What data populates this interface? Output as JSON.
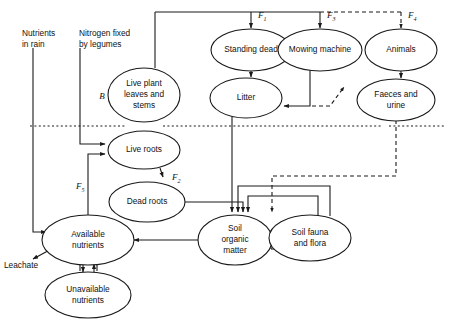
{
  "figure": {
    "type": "flow-diagram",
    "boundary_label": "soil surface dotted line"
  },
  "nodes": {
    "standing_dead": {
      "label": "Standing dead",
      "cx": 251,
      "cy": 50,
      "rx": 40,
      "ry": 20
    },
    "mowing_machine": {
      "label": "Mowing machine",
      "cx": 320,
      "cy": 50,
      "rx": 42,
      "ry": 20
    },
    "animals": {
      "label": "Animals",
      "cx": 401,
      "cy": 50,
      "rx": 36,
      "ry": 20
    },
    "litter": {
      "label": "Litter",
      "cx": 246,
      "cy": 98,
      "rx": 34,
      "ry": 19
    },
    "faeces_and_urine": {
      "label_line1": "Faeces and",
      "label_line2": "urine",
      "cx": 396,
      "cy": 100,
      "rx": 38,
      "ry": 20
    },
    "live_plant": {
      "label_line1": "Live plant",
      "label_line2": "leaves and",
      "label_line3": "stems",
      "cx": 144,
      "cy": 95,
      "rx": 36,
      "ry": 26
    },
    "live_roots": {
      "label": "Live roots",
      "cx": 144,
      "cy": 150,
      "rx": 36,
      "ry": 19
    },
    "dead_roots": {
      "label": "Dead roots",
      "cx": 147,
      "cy": 202,
      "rx": 37,
      "ry": 19
    },
    "available_nutrients": {
      "label_line1": "Available",
      "label_line2": "nutrients",
      "cx": 88,
      "cy": 240,
      "rx": 45,
      "ry": 24
    },
    "unavailable_nutrients": {
      "label_line1": "Unavailable",
      "label_line2": "nutrients",
      "cx": 88,
      "cy": 295,
      "rx": 42,
      "ry": 22
    },
    "soil_organic_matter": {
      "label_line1": "Soil",
      "label_line2": "organic",
      "label_line3": "matter",
      "cx": 235,
      "cy": 240,
      "rx": 36,
      "ry": 24
    },
    "soil_fauna_and_flora": {
      "label_line1": "Soil fauna",
      "label_line2": "and flora",
      "cx": 310,
      "cy": 238,
      "rx": 40,
      "ry": 22
    }
  },
  "external_labels": {
    "nutrients_in_rain": {
      "line1": "Nutrients",
      "line2": "in rain",
      "x": 40,
      "y": 36
    },
    "nitrogen_fixed": {
      "line1": "Nitrogen fixed",
      "line2": "by legumes",
      "x": 118,
      "y": 36
    },
    "leachate": {
      "text": "Leachate",
      "x": 6,
      "y": 266
    }
  },
  "flux_labels": [
    {
      "name": "F1",
      "base": "F",
      "sub": "1",
      "x": 258,
      "y": 17
    },
    {
      "name": "F3",
      "base": "F",
      "sub": "3",
      "x": 327,
      "y": 17
    },
    {
      "name": "F4",
      "base": "F",
      "sub": "4",
      "x": 408,
      "y": 17
    },
    {
      "name": "F2",
      "base": "F",
      "sub": "2",
      "x": 175,
      "y": 180
    },
    {
      "name": "F5",
      "base": "F",
      "sub": "5",
      "x": 78,
      "y": 188
    },
    {
      "name": "B",
      "base": "B",
      "sub": "",
      "x": 102,
      "y": 98
    }
  ],
  "colors": {
    "ink": "#1a1a1a",
    "paper": "#ffffff"
  }
}
